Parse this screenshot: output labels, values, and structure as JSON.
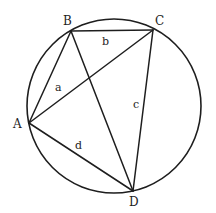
{
  "diagram": {
    "type": "cyclic quadrilateral inscribed in circle",
    "circle": {
      "cx": 114,
      "cy": 106,
      "r": 87
    },
    "points": {
      "A": {
        "label": "A",
        "x": 29,
        "y": 123,
        "label_x": 13,
        "label_y": 128
      },
      "B": {
        "label": "B",
        "x": 71,
        "y": 31,
        "label_x": 63,
        "label_y": 25
      },
      "C": {
        "label": "C",
        "x": 153,
        "y": 30,
        "label_x": 155,
        "label_y": 25
      },
      "D": {
        "label": "D",
        "x": 133,
        "y": 191,
        "label_x": 129,
        "label_y": 206
      }
    },
    "segments": [
      {
        "from": "A",
        "to": "B",
        "label": "a",
        "label_x": 55,
        "label_y": 91
      },
      {
        "from": "B",
        "to": "C",
        "label": "b",
        "label_x": 102,
        "label_y": 45
      },
      {
        "from": "C",
        "to": "D",
        "label": "c",
        "label_x": 133,
        "label_y": 108
      },
      {
        "from": "A",
        "to": "D",
        "label": "d",
        "label_x": 75,
        "label_y": 149
      },
      {
        "from": "A",
        "to": "C",
        "label": ""
      },
      {
        "from": "B",
        "to": "D",
        "label": ""
      }
    ]
  }
}
